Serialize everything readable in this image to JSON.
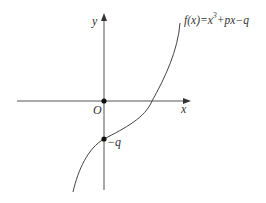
{
  "diagram": {
    "function_label": {
      "prefix": "f(x)=x",
      "exponent": "3",
      "suffix": "+px−q"
    },
    "axes": {
      "x_label": "x",
      "y_label": "y",
      "origin_label": "O"
    },
    "points": {
      "intercept_label": "−q"
    },
    "colors": {
      "axis": "#555555",
      "curve": "#444444",
      "text": "#333333"
    }
  }
}
